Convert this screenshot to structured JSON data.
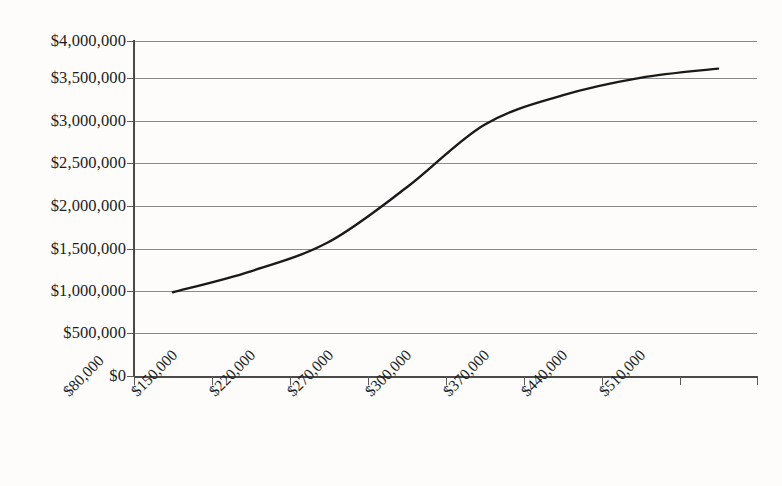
{
  "chart_data": {
    "type": "line",
    "title": "",
    "subtitle": "",
    "xlabel": "",
    "ylabel": "",
    "categories": [
      "$80,000",
      "$150,000",
      "$220,000",
      "$270,000",
      "$300,000",
      "$370,000",
      "$440,000",
      "$510,000"
    ],
    "x": [
      80000,
      150000,
      220000,
      270000,
      300000,
      370000,
      440000,
      510000
    ],
    "values": [
      1000000,
      1250000,
      1600000,
      2250000,
      3000000,
      3350000,
      3560000,
      3670000
    ],
    "series": [
      {
        "name": "",
        "values": [
          1000000,
          1250000,
          1600000,
          2250000,
          3000000,
          3350000,
          3560000,
          3670000
        ]
      }
    ],
    "ylim": [
      0,
      4000000
    ],
    "y_ticks": [
      0,
      500000,
      1000000,
      1500000,
      2000000,
      2500000,
      3000000,
      3500000,
      4000000
    ],
    "y_tick_labels": [
      "$0",
      "$500,000",
      "$1,000,000",
      "$1,500,000",
      "$2,000,000",
      "$2,500,000",
      "$3,000,000",
      "$3,500,000",
      "$4,000,000"
    ],
    "x_tick_labels": [
      "$80,000",
      "$150,000",
      "$220,000",
      "$270,000",
      "$300,000",
      "$370,000",
      "$440,000",
      "$510,000"
    ],
    "grid": "horizontal",
    "legend": "none",
    "line_color": "#1a1a1a",
    "grid_color": "#8a8a8a",
    "axis_color": "#4a4a4a",
    "background_color": "#fdfcfa",
    "markers": "none",
    "smooth": true
  },
  "axes": {
    "y_label_0": "$0",
    "y_label_1": "$500,000",
    "y_label_2": "$1,000,000",
    "y_label_3": "$1,500,000",
    "y_label_4": "$2,000,000",
    "y_label_5": "$2,500,000",
    "y_label_6": "$3,000,000",
    "y_label_7": "$3,500,000",
    "y_label_8": "$4,000,000",
    "x_label_0": "$80,000",
    "x_label_1": "$150,000",
    "x_label_2": "$220,000",
    "x_label_3": "$270,000",
    "x_label_4": "$300,000",
    "x_label_5": "$370,000",
    "x_label_6": "$440,000",
    "x_label_7": "$510,000"
  }
}
